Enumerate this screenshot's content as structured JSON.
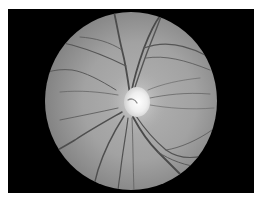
{
  "image": {
    "subject": "Retinal fundus photograph (grayscale)",
    "features": [
      "black-rectangular-frame",
      "circular-fundus-field",
      "optic-disc",
      "retinal-blood-vessels"
    ],
    "colors": {
      "page_background": "#ffffff",
      "frame": "#000000",
      "fundus_center": "#a6a6a6",
      "fundus_edge": "#7e7e7e",
      "optic_disc": "#f4f4f4",
      "vessel": "#4a4a4a"
    },
    "geometry": {
      "frame": {
        "x": 8,
        "y": 9,
        "width": 246,
        "height": 184
      },
      "fundus": {
        "cx": 131,
        "cy": 101,
        "rx": 86,
        "ry": 89
      },
      "optic_disc": {
        "cx": 137,
        "cy": 102,
        "rx": 13,
        "ry": 15
      }
    }
  }
}
